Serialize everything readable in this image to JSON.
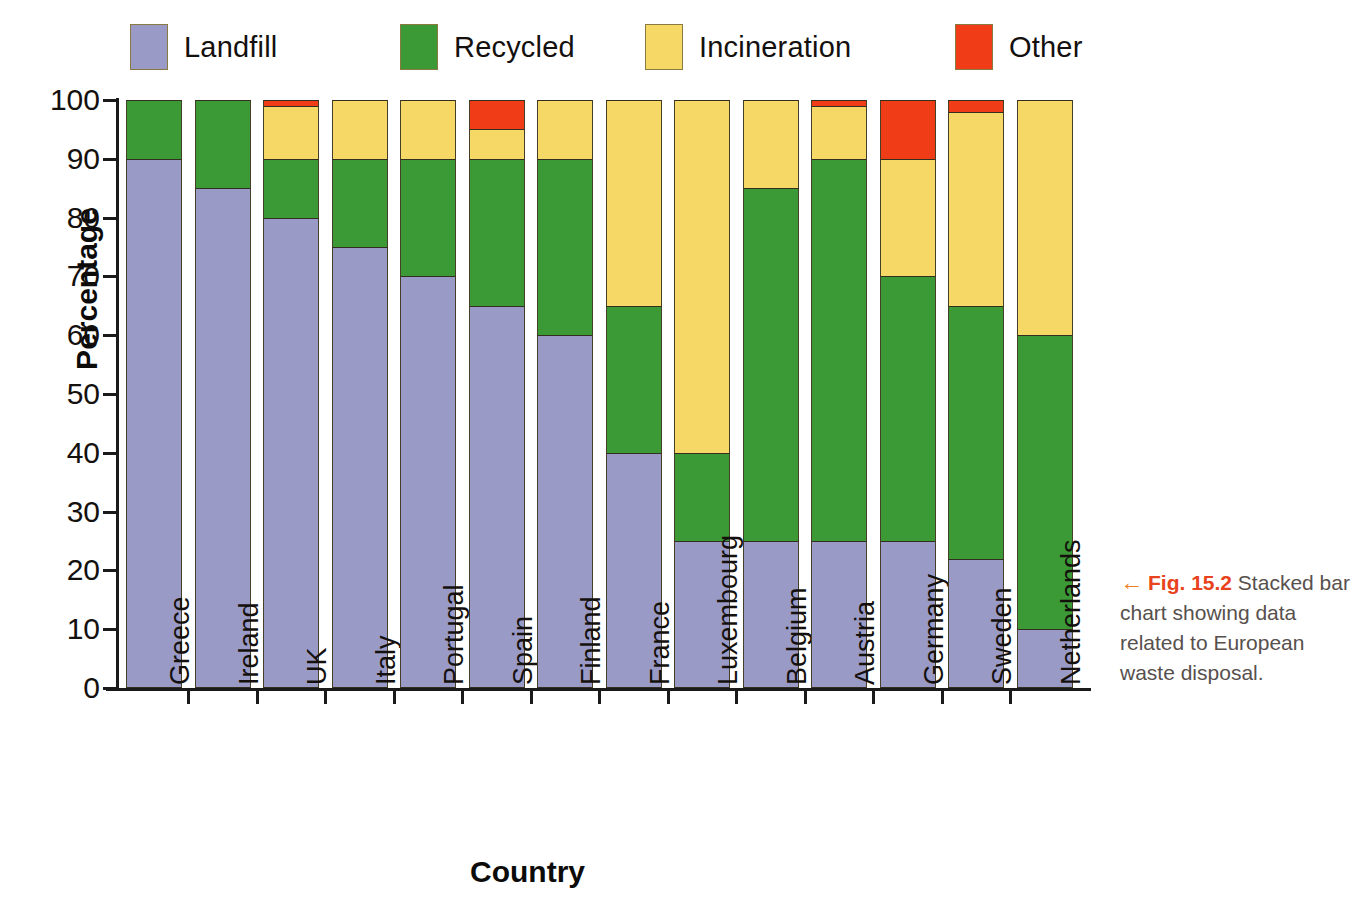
{
  "legend": {
    "items": [
      {
        "label": "Landfill",
        "color": "#9a9ac6",
        "icon": "legend-swatch-landfill"
      },
      {
        "label": "Recycled",
        "color": "#3b9a35",
        "icon": "legend-swatch-recycled"
      },
      {
        "label": "Incineration",
        "color": "#f5d866",
        "icon": "legend-swatch-incineration"
      },
      {
        "label": "Other",
        "color": "#f03d18",
        "icon": "legend-swatch-other"
      }
    ]
  },
  "caption": {
    "arrow": "←",
    "fig_number": "Fig. 15.2",
    "text": " Stacked bar chart showing data related to European waste disposal."
  },
  "chart_data": {
    "type": "bar",
    "stacked": true,
    "title": "",
    "xlabel": "Country",
    "ylabel": "Percentage",
    "ylim": [
      0,
      100
    ],
    "ytick_labels": [
      "0",
      "10",
      "20",
      "30",
      "40",
      "50",
      "60",
      "70",
      "80",
      "90",
      "100"
    ],
    "yticks": [
      0,
      10,
      20,
      30,
      40,
      50,
      60,
      70,
      80,
      90,
      100
    ],
    "grid": false,
    "legend_position": "top",
    "categories": [
      "Greece",
      "Ireland",
      "UK",
      "Italy",
      "Portugal",
      "Spain",
      "Finland",
      "France",
      "Luxembourg",
      "Belgium",
      "Austria",
      "Germany",
      "Sweden",
      "Netherlands"
    ],
    "series": [
      {
        "name": "Landfill",
        "color": "#9a9ac6",
        "values": [
          90,
          85,
          80,
          75,
          70,
          65,
          60,
          40,
          25,
          25,
          25,
          25,
          22,
          10
        ]
      },
      {
        "name": "Recycled",
        "color": "#3b9a35",
        "values": [
          10,
          15,
          10,
          15,
          20,
          25,
          30,
          25,
          15,
          60,
          65,
          45,
          43,
          50
        ]
      },
      {
        "name": "Incineration",
        "color": "#f5d866",
        "values": [
          0,
          0,
          9,
          10,
          10,
          5,
          10,
          35,
          60,
          15,
          9,
          20,
          33,
          40
        ]
      },
      {
        "name": "Other",
        "color": "#f03d18",
        "values": [
          0,
          0,
          1,
          0,
          0,
          5,
          0,
          0,
          0,
          0,
          1,
          10,
          2,
          0
        ]
      }
    ]
  }
}
